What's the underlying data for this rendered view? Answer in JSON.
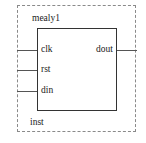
{
  "block": {
    "title": "mealy1",
    "instance_label": "inst",
    "inputs": [
      {
        "name": "clk"
      },
      {
        "name": "rst"
      },
      {
        "name": "din"
      }
    ],
    "outputs": [
      {
        "name": "dout"
      }
    ]
  },
  "colors": {
    "border_dashed": "#8a8a8a",
    "block_border": "#333333",
    "wire": "#555555",
    "text": "#1a1a1a",
    "background": "#ffffff"
  }
}
